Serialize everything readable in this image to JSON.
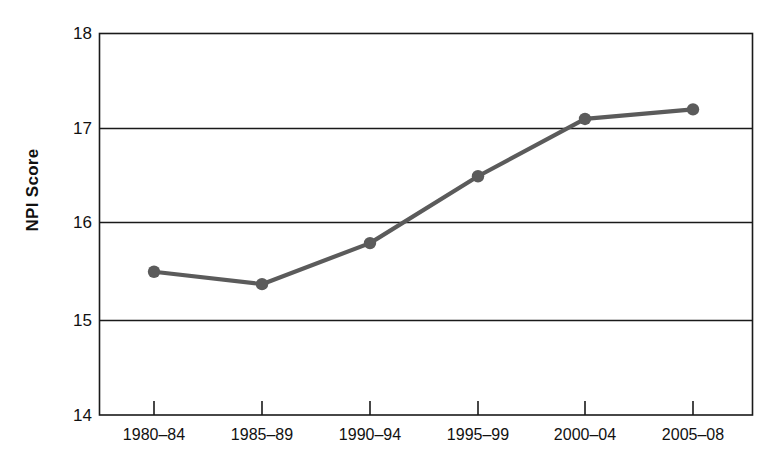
{
  "chart_data": {
    "type": "line",
    "title": "",
    "xlabel": "",
    "ylabel": "NPI Score",
    "categories": [
      "1980–84",
      "1985–89",
      "1990–94",
      "1995–99",
      "2000–04",
      "2005–08"
    ],
    "values": [
      15.5,
      15.37,
      15.8,
      16.5,
      17.1,
      17.2
    ],
    "series": [
      {
        "name": "NPI Score",
        "values": [
          15.5,
          15.37,
          15.8,
          16.5,
          17.1,
          17.2
        ]
      }
    ],
    "ylim": [
      14,
      18
    ],
    "yticks": [
      14,
      15,
      16,
      17,
      18
    ],
    "ytick_labels": [
      "14",
      "15",
      "16",
      "17",
      "18"
    ],
    "grid": "horizontal",
    "legend": "none",
    "marker": "circle",
    "line_color": "#5b5b5b",
    "marker_color": "#5b5b5b",
    "axis_color": "#1a1a1a",
    "grid_color": "#1a1a1a",
    "background_color": "#ffffff"
  },
  "axes": {
    "y_title": "NPI Score",
    "y_ticks": [
      {
        "label": "18",
        "value": 18
      },
      {
        "label": "17",
        "value": 17
      },
      {
        "label": "16",
        "value": 16
      },
      {
        "label": "15",
        "value": 15
      },
      {
        "label": "14",
        "value": 14
      }
    ],
    "x_ticks": [
      {
        "label": "1980–84"
      },
      {
        "label": "1985–89"
      },
      {
        "label": "1990–94"
      },
      {
        "label": "1995–99"
      },
      {
        "label": "2000–04"
      },
      {
        "label": "2005–08"
      }
    ]
  }
}
